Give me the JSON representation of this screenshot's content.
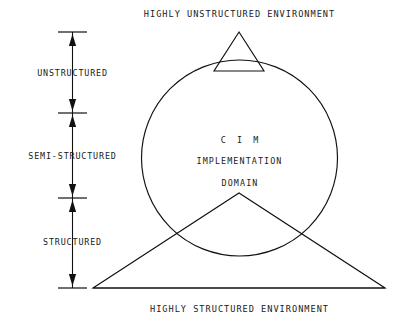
{
  "diagram": {
    "background_color": "#ffffff",
    "stroke_color": "#111111",
    "text_color": "#1a1a1a",
    "labels": {
      "top_environment": "HIGHLY UNSTRUCTURED ENVIRONMENT",
      "bottom_environment": "HIGHLY STRUCTURED ENVIRONMENT"
    },
    "core": {
      "line1": "C I M",
      "line2": "IMPLEMENTATION",
      "line3": "DOMAIN"
    },
    "scale_bands": [
      {
        "label": "UNSTRUCTURED"
      },
      {
        "label": "SEMI-STRUCTURED"
      },
      {
        "label": "STRUCTURED"
      }
    ],
    "icons": {
      "arrow_up": "arrow-up-icon",
      "arrow_down": "arrow-down-icon",
      "tick": "tick-mark-icon"
    }
  }
}
